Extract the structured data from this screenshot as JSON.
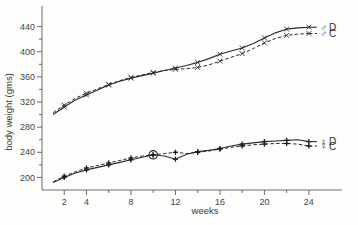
{
  "chart_data": {
    "type": "line",
    "title": "",
    "xlabel": "weeks",
    "ylabel": "body weight (gms)",
    "xlim": [
      0,
      25
    ],
    "ylim": [
      180,
      460
    ],
    "grid": false,
    "legend_position": "right-inline",
    "x_ticks": [
      2,
      4,
      6,
      8,
      10,
      12,
      14,
      16,
      18,
      20,
      22,
      24
    ],
    "x_tick_labels": [
      "2",
      "4",
      "",
      "8",
      "",
      "12",
      "",
      "16",
      "",
      "20",
      "",
      "24"
    ],
    "y_ticks": [
      200,
      220,
      240,
      260,
      280,
      300,
      320,
      340,
      360,
      380,
      400,
      420,
      440
    ],
    "y_tick_labels": [
      "200",
      "",
      "240",
      "",
      "280",
      "",
      "320",
      "",
      "360",
      "",
      "400",
      "",
      "440"
    ],
    "series": [
      {
        "name": "male-D",
        "legend_symbol": "♂",
        "legend_label": "D",
        "line_style": "solid",
        "marker": "x",
        "x": [
          1,
          2,
          3,
          4,
          5,
          6,
          7,
          8,
          9,
          10,
          11,
          12,
          13,
          14,
          15,
          16,
          17,
          18,
          19,
          20,
          21,
          22,
          23,
          24
        ],
        "y": [
          300,
          312,
          323,
          331,
          339,
          347,
          353,
          358,
          362,
          366,
          370,
          374,
          378,
          383,
          389,
          396,
          401,
          406,
          413,
          422,
          430,
          436,
          438,
          439
        ]
      },
      {
        "name": "male-C",
        "legend_symbol": "♂",
        "legend_label": "C",
        "line_style": "dashed",
        "marker": "x",
        "x": [
          1,
          2,
          3,
          4,
          5,
          6,
          7,
          8,
          9,
          10,
          11,
          12,
          13,
          14,
          15,
          16,
          17,
          18,
          19,
          20,
          21,
          22,
          23,
          24
        ],
        "y": [
          303,
          315,
          326,
          334,
          341,
          348,
          354,
          359,
          363,
          367,
          370,
          372,
          373,
          375,
          379,
          385,
          391,
          397,
          405,
          414,
          421,
          426,
          428,
          429
        ]
      },
      {
        "name": "female-D",
        "legend_symbol": "♀",
        "legend_label": "D",
        "line_style": "solid",
        "marker": "plus",
        "x": [
          1,
          2,
          3,
          4,
          5,
          6,
          7,
          8,
          9,
          10,
          11,
          12,
          13,
          14,
          15,
          16,
          17,
          18,
          19,
          20,
          21,
          22,
          23,
          24
        ],
        "y": [
          192,
          200,
          207,
          212,
          216,
          220,
          224,
          228,
          232,
          236,
          234,
          229,
          237,
          241,
          243,
          246,
          250,
          253,
          255,
          257,
          258,
          259,
          260,
          257
        ]
      },
      {
        "name": "female-C",
        "legend_symbol": "♀",
        "legend_label": "C",
        "line_style": "dashed",
        "marker": "plus",
        "x": [
          1,
          2,
          3,
          4,
          5,
          6,
          7,
          8,
          9,
          10,
          11,
          12,
          13,
          14,
          15,
          16,
          17,
          18,
          19,
          20,
          21,
          22,
          23,
          24
        ],
        "y": [
          193,
          202,
          209,
          215,
          219,
          223,
          227,
          231,
          234,
          236,
          238,
          240,
          238,
          240,
          242,
          245,
          248,
          250,
          252,
          253,
          254,
          254,
          253,
          250
        ]
      }
    ],
    "annotations": [
      {
        "type": "circled-point",
        "series": "female-D",
        "x": 10,
        "y": 236,
        "note": "circled data point"
      }
    ]
  },
  "legend": {
    "entries": [
      {
        "symbol": "♂",
        "label": "D",
        "style": "solid",
        "marker": "x"
      },
      {
        "symbol": "♂",
        "label": "C",
        "style": "dashed",
        "marker": "x"
      },
      {
        "symbol": "♀",
        "label": "D",
        "style": "solid",
        "marker": "plus"
      },
      {
        "symbol": "♀",
        "label": "C",
        "style": "dashed",
        "marker": "plus"
      }
    ]
  },
  "colors": {
    "ink": "#2b2b2b",
    "axis": "#6d6d6d",
    "background": "#fdfdfc"
  }
}
